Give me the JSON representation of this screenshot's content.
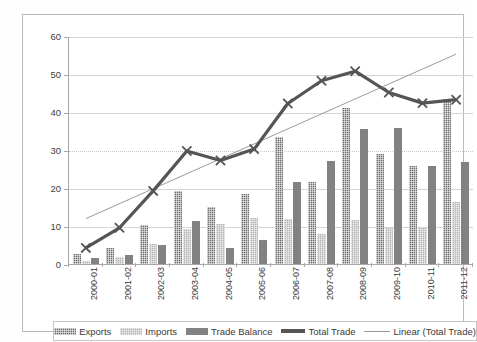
{
  "chart_data": {
    "type": "bar",
    "title": "",
    "xlabel": "",
    "ylabel": "",
    "ylim": [
      0,
      60
    ],
    "yticks": [
      0,
      10,
      20,
      30,
      40,
      50,
      60
    ],
    "grid": true,
    "legend_position": "bottom",
    "categories": [
      "2000-01",
      "2001-02",
      "2002-03",
      "2003-04",
      "2004-05",
      "2005-06",
      "2006-07",
      "2007-08",
      "2008-09",
      "2009-10",
      "2010-11",
      "2011-12"
    ],
    "series": [
      {
        "name": "Exports",
        "type": "bar",
        "values": [
          2.7,
          4.3,
          10.2,
          19.1,
          15.0,
          18.5,
          33.5,
          21.6,
          41.0,
          29.0,
          25.7,
          43.4
        ]
      },
      {
        "name": "Imports",
        "type": "bar",
        "values": [
          0.9,
          1.9,
          5.2,
          9.1,
          10.5,
          12.0,
          11.8,
          8.0,
          11.6,
          9.6,
          9.4,
          16.2
        ]
      },
      {
        "name": "Trade Balance",
        "type": "bar",
        "values": [
          1.6,
          2.3,
          5.0,
          11.4,
          4.2,
          6.2,
          21.6,
          27.0,
          35.6,
          35.7,
          25.7,
          26.9
        ]
      },
      {
        "name": "Total Trade",
        "type": "line",
        "marker": "x",
        "values": [
          4.5,
          9.8,
          19.5,
          30.0,
          27.5,
          30.5,
          42.5,
          48.5,
          51.0,
          45.4,
          42.6,
          43.5
        ]
      },
      {
        "name": "Linear (Total Trade)",
        "type": "trendline",
        "endpoints": [
          12.2,
          55.5
        ]
      }
    ],
    "colors": {
      "exports": "#6e6e6e",
      "imports": "#b3b3b3",
      "trade_balance": "#828282",
      "total_trade": "#555555",
      "linear_trendline": "#9a9a9a",
      "gridline": "#d4d4d4",
      "axis": "#a8a8a8",
      "background": "#ffffff",
      "text": "#3a3a3a"
    }
  },
  "legend": {
    "items": [
      {
        "label": "Exports",
        "key": "exports"
      },
      {
        "label": "Imports",
        "key": "imports"
      },
      {
        "label": "Trade Balance",
        "key": "balance"
      },
      {
        "label": "Total Trade",
        "key": "total"
      },
      {
        "label": "Linear (Total Trade)",
        "key": "linear"
      }
    ]
  }
}
